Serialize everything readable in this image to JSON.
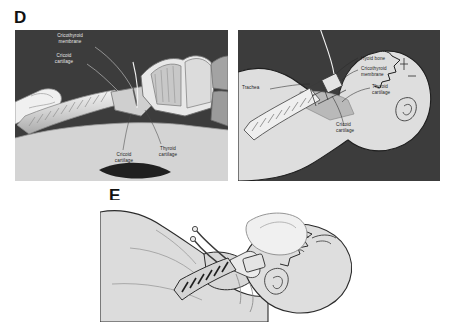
{
  "figure": {
    "panels": [
      {
        "id": "D",
        "letter": "D",
        "views": [
          {
            "id": "d-left",
            "view_name": "midsagittal-larynx-section",
            "background_color": "#3c3c3c",
            "labels": [
              {
                "id": "cricothyroid-membrane",
                "text": "Cricothyroid\nmembrane",
                "tone": "light"
              },
              {
                "id": "cricoid-cartilage-upper",
                "text": "Cricoid\ncartilage",
                "tone": "light"
              },
              {
                "id": "cricoid-cartilage-lower",
                "text": "Cricoid\ncartilage",
                "tone": "dark"
              },
              {
                "id": "thyroid-cartilage",
                "text": "Thyroid\ncartilage",
                "tone": "dark"
              }
            ]
          },
          {
            "id": "d-right",
            "view_name": "lateral-neck-tracheostomy-tube",
            "background_color": "#3c3c3c",
            "labels": [
              {
                "id": "trachea",
                "text": "Trachea",
                "tone": "dark"
              },
              {
                "id": "hyoid-bone",
                "text": "Hyoid bone",
                "tone": "dark"
              },
              {
                "id": "cricothyroid-membrane",
                "text": "Cricothyroid\nmembrane",
                "tone": "dark"
              },
              {
                "id": "thyroid-cartilage",
                "text": "Thyroid\ncartilage",
                "tone": "dark"
              },
              {
                "id": "cricoid-cartilage",
                "text": "Cricoid\ncartilage",
                "tone": "dark"
              }
            ]
          }
        ]
      },
      {
        "id": "E",
        "letter": "E",
        "views": [
          {
            "id": "e-main",
            "view_name": "supine-patient-airway-device-placement",
            "background_color": "#ffffff",
            "labels": []
          }
        ]
      }
    ]
  },
  "colors": {
    "panel_dark_background": "#3c3c3c",
    "tissue_light": "#dcdcdc",
    "tissue_mid": "#b4b4b4",
    "tissue_dark": "#8c8c8c",
    "cartilage_pale": "#efefef",
    "outline": "#2a2a2a",
    "label_light": "#e8e8e8",
    "label_dark": "#1c1c1c",
    "page_background": "#ffffff"
  }
}
